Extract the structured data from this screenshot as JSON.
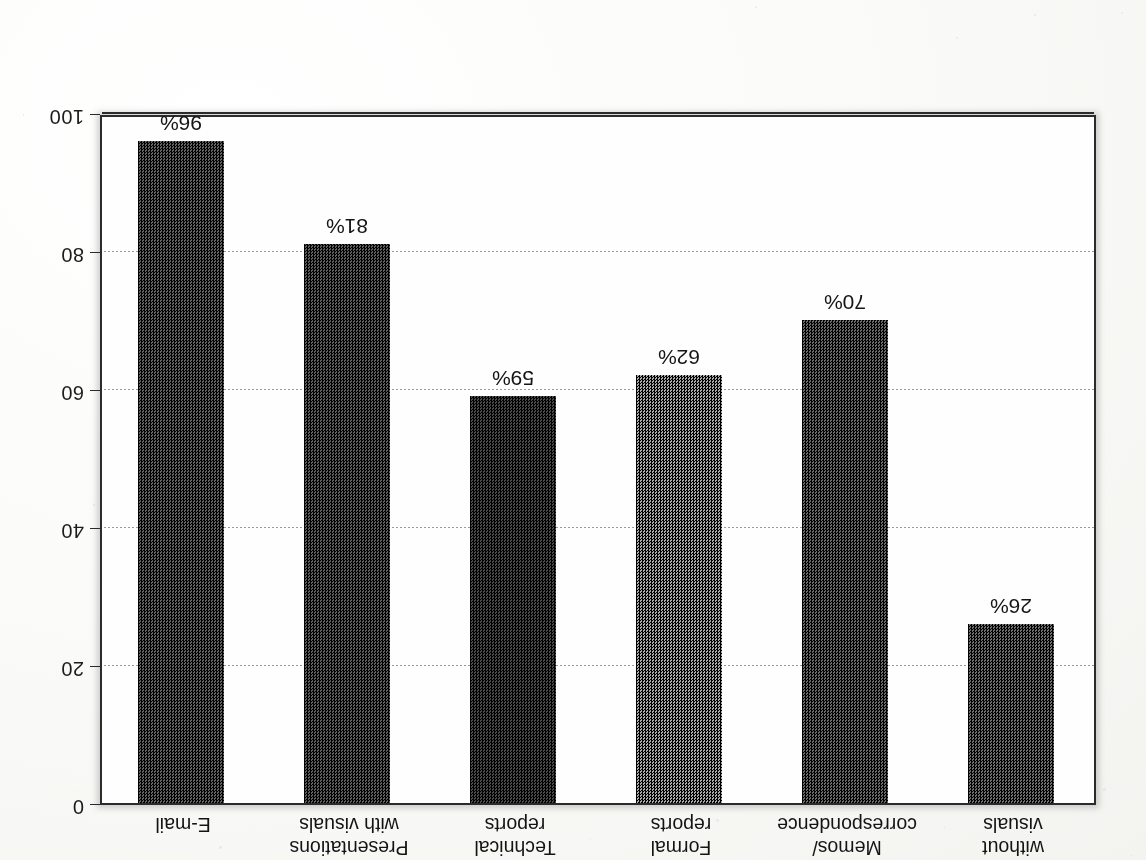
{
  "chart_data": {
    "type": "bar",
    "title": "",
    "subtitle": "",
    "xlabel": "",
    "ylabel": "",
    "orientation": "vertical-inverted",
    "grid": true,
    "legend": "none",
    "ylim": [
      0,
      100
    ],
    "yticks": [
      "0",
      "20",
      "40",
      "60",
      "80",
      "100"
    ],
    "ytick_values": [
      0,
      20,
      40,
      60,
      80,
      100
    ],
    "categories": [
      "Presentations\nwithout\nvisuals",
      "Memos/\ncorrespondence",
      "Formal\nreports",
      "Technical\nreports",
      "Presentations\nwith visuals",
      "E-mail"
    ],
    "values": [
      26,
      70,
      62,
      59,
      81,
      96
    ],
    "value_labels": [
      "26%",
      "70%",
      "62%",
      "59%",
      "81%",
      "96%"
    ],
    "bar_colors": [
      "#6f6f6f",
      "#6a6a6a",
      "#a9a9a9",
      "#4a4a4a",
      "#5e5e5e",
      "#636363"
    ]
  },
  "page": {
    "rotation": "180deg",
    "background": "#fdfdfb",
    "axis_color": "#2b2b2b",
    "grid_color": "#9a9a9a",
    "text_color": "#141414"
  }
}
